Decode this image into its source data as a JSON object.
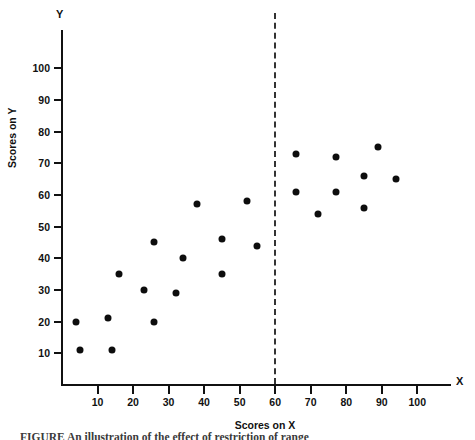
{
  "chart_data": {
    "type": "scatter",
    "title": "",
    "xlabel": "Scores on X",
    "ylabel": "Scores on Y",
    "x_axis_letter": "X",
    "y_axis_letter": "Y",
    "xlim": [
      0,
      110
    ],
    "ylim": [
      0,
      110
    ],
    "xticks": [
      10,
      20,
      30,
      40,
      50,
      60,
      70,
      80,
      90,
      100
    ],
    "yticks": [
      10,
      20,
      30,
      40,
      50,
      60,
      70,
      80,
      90,
      100
    ],
    "xtick_labels": [
      "10",
      "20",
      "30",
      "40",
      "50",
      "60",
      "70",
      "80",
      "90",
      "100"
    ],
    "ytick_labels": [
      "10",
      "20",
      "30",
      "40",
      "50",
      "60",
      "70",
      "80",
      "90",
      "100"
    ],
    "grid": false,
    "legend": false,
    "marker": "filled-circle",
    "marker_color": "#0d0d0d",
    "marker_size_px": 7,
    "annotations": [
      {
        "type": "vertical-dashed-line",
        "name": "restriction-of-range-cut-line",
        "x": 60,
        "label": "",
        "color": "#333333",
        "dashed": true
      }
    ],
    "series": [
      {
        "name": "unrestricted-range-points",
        "points": [
          [
            4,
            20
          ],
          [
            5,
            11
          ],
          [
            13,
            21
          ],
          [
            14,
            11
          ],
          [
            16,
            35
          ],
          [
            23,
            30
          ],
          [
            26,
            45
          ],
          [
            26,
            20
          ],
          [
            32,
            29
          ],
          [
            34,
            40
          ],
          [
            38,
            57
          ],
          [
            45,
            46
          ],
          [
            45,
            35
          ],
          [
            52,
            58
          ],
          [
            55,
            44
          ]
        ]
      },
      {
        "name": "restricted-range-points",
        "points": [
          [
            66,
            73
          ],
          [
            66,
            61
          ],
          [
            72,
            54
          ],
          [
            77,
            72
          ],
          [
            77,
            61
          ],
          [
            85,
            66
          ],
          [
            85,
            56
          ],
          [
            89,
            75
          ],
          [
            94,
            65
          ]
        ]
      }
    ]
  },
  "caption": {
    "text": "FIGURE       An illustration of the effect of restriction of range"
  }
}
